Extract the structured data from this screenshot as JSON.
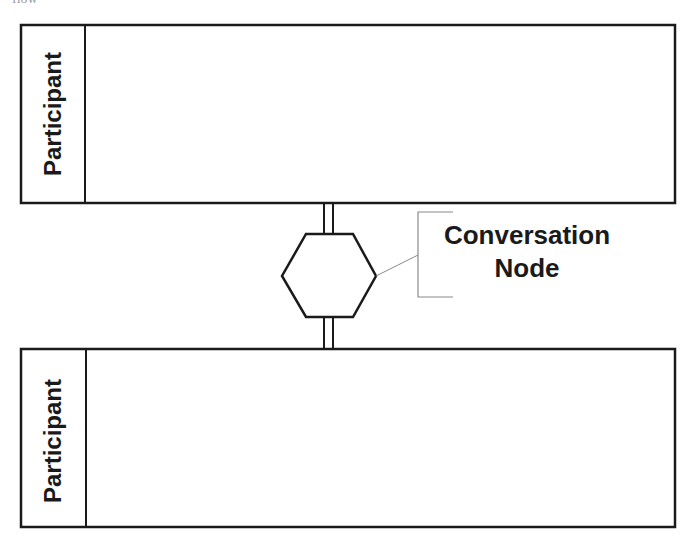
{
  "caption": {
    "text": "flow"
  },
  "diagram": {
    "pools": [
      {
        "label": "Participant"
      },
      {
        "label": "Participant"
      }
    ],
    "conversation_node": {
      "shape": "hexagon",
      "annotation": {
        "line1": "Conversation",
        "line2": "Node"
      }
    },
    "colors": {
      "stroke": "#1a1a1a",
      "annotation": "#8a8a8a",
      "background": "#ffffff"
    }
  }
}
